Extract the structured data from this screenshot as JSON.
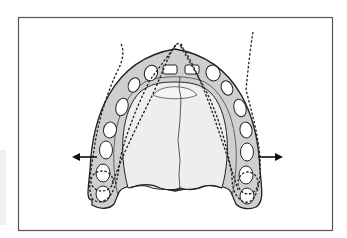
{
  "figure": {
    "colors": {
      "background": "#ffffff",
      "frame": "#555555",
      "arch_fill": "#cfcfcf",
      "palate_fill": "#eeeeee",
      "outline": "#222222",
      "socket_fill": "#ffffff"
    },
    "arrows": [
      {
        "name": "left-expansion-arrow",
        "direction": "left"
      },
      {
        "name": "right-expansion-arrow",
        "direction": "right"
      }
    ],
    "tooth_sockets_per_side": 7
  }
}
